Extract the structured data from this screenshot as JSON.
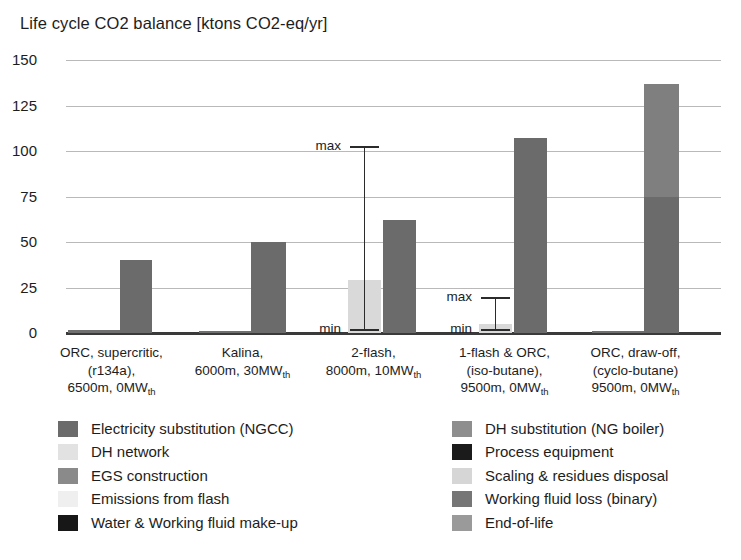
{
  "chart_data": {
    "type": "bar",
    "title": "Life cycle CO2 balance [ktons CO2-eq/yr]",
    "xlabel": "",
    "ylabel": "",
    "ylim": [
      0,
      150
    ],
    "ytick_values": [
      0,
      25,
      50,
      75,
      100,
      125,
      150
    ],
    "ytick_labels": [
      "0",
      "25",
      "50",
      "75",
      "100",
      "125",
      "150"
    ],
    "grid": true,
    "legend_position": "bottom",
    "categories": [
      "ORC, supercritic, (r134a), 6500m, 0MWth",
      "Kalina, 6000m, 30MWth",
      "2-flash, 8000m, 10MWth",
      "1-flash & ORC, (iso-butane), 9500m, 0MWth",
      "ORC, draw-off, (cyclo-butane) 9500m, 0MWth"
    ],
    "category_label_lines": [
      [
        "ORC, supercritic,",
        "(r134a),",
        "6500m, 0MW|th"
      ],
      [
        "Kalina,",
        "6000m, 30MW|th",
        ""
      ],
      [
        "2-flash,",
        "8000m, 10MW|th",
        ""
      ],
      [
        "1-flash & ORC,",
        "(iso-butane),",
        "9500m, 0MW|th"
      ],
      [
        "ORC, draw-off,",
        "(cyclo-butane)",
        "9500m, 0MW|th"
      ]
    ],
    "groups": [
      {
        "category": "ORC, supercritic, (r134a), 6500m, 0MWth",
        "bars": [
          {
            "series": "EGS construction",
            "value": 1.5,
            "color": "#6f6f6f",
            "width_px": 52,
            "offset_px": 2
          },
          {
            "series": "Electricity substitution (NGCC)",
            "value": 40,
            "color": "#6b6b6b",
            "width_px": 32,
            "offset_px": 54
          }
        ],
        "error_bar": null
      },
      {
        "category": "Kalina, 6000m, 30MWth",
        "bars": [
          {
            "series": "EGS construction",
            "value": 1.2,
            "color": "#6f6f6f",
            "width_px": 52,
            "offset_px": 2
          },
          {
            "series": "Electricity substitution (NGCC)",
            "value": 50,
            "color": "#6b6b6b",
            "width_px": 35,
            "offset_px": 54
          }
        ],
        "error_bar": null
      },
      {
        "category": "2-flash, 8000m, 10MWth",
        "bars": [
          {
            "series": "Emissions from flash",
            "value": 29,
            "color": "#d9d9d9",
            "width_px": 33,
            "offset_px": 20
          },
          {
            "series": "Electricity substitution (NGCC)",
            "value": 62,
            "color": "#6b6b6b",
            "width_px": 33,
            "offset_px": 55
          }
        ],
        "error_bar": {
          "min": 2,
          "max": 103,
          "min_label": "min",
          "max_label": "max",
          "x_px": 36
        }
      },
      {
        "category": "1-flash & ORC, (iso-butane), 9500m, 0MWth",
        "bars": [
          {
            "series": "Emissions from flash",
            "value": 5,
            "color": "#d9d9d9",
            "width_px": 33,
            "offset_px": 20
          },
          {
            "series": "Electricity substitution (NGCC)",
            "value": 107,
            "color": "#6b6b6b",
            "width_px": 33,
            "offset_px": 55
          }
        ],
        "error_bar": {
          "min": 2,
          "max": 20,
          "min_label": "min",
          "max_label": "max",
          "x_px": 36
        }
      },
      {
        "category": "ORC, draw-off, (cyclo-butane) 9500m, 0MWth",
        "bars": [
          {
            "series": "EGS construction",
            "value": 1.2,
            "color": "#6f6f6f",
            "width_px": 52,
            "offset_px": 2
          },
          {
            "series": "stacked",
            "value": 137,
            "color": "#6b6b6b",
            "width_px": 35,
            "offset_px": 54,
            "stack": [
              {
                "series": "Electricity substitution (NGCC)",
                "from": 0,
                "to": 75,
                "color": "#6b6b6b"
              },
              {
                "series": "DH substitution (NG boiler)",
                "from": 75,
                "to": 137,
                "color": "#7f7f7f"
              }
            ]
          }
        ],
        "error_bar": null
      }
    ],
    "legend": {
      "left_column": [
        {
          "label": "Electricity substitution (NGCC)",
          "color": "#6b6b6b"
        },
        {
          "label": "DH network",
          "color": "#e2e2e2"
        },
        {
          "label": "EGS construction",
          "color": "#8a8a8a"
        },
        {
          "label": "Emissions from flash",
          "color": "#efefef"
        },
        {
          "label": "Water & Working fluid make-up",
          "color": "#171717"
        }
      ],
      "right_column": [
        {
          "label": "DH substitution (NG boiler)",
          "color": "#8e8e8e"
        },
        {
          "label": "Process equipment",
          "color": "#1b1b1b"
        },
        {
          "label": "Scaling & residues disposal",
          "color": "#d6d6d6"
        },
        {
          "label": "Working fluid loss (binary)",
          "color": "#767676"
        },
        {
          "label": "End-of-life",
          "color": "#9a9a9a"
        }
      ]
    }
  }
}
